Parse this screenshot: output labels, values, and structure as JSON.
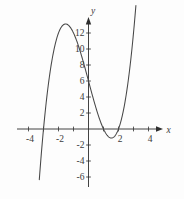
{
  "figure": {
    "background": "#fdfdfd",
    "axis_color": "#2e2e2e",
    "curve_color": "#474747",
    "text_color": "#3b3b3b",
    "x_axis_label": "x",
    "y_axis_label": "y"
  },
  "chart_data": {
    "type": "line",
    "title": "",
    "function": "y = x^3 - 7x + 6",
    "function_factored": "y = (x + 3)(x - 1)(x - 2)",
    "coefficients": {
      "x3": 1,
      "x2": 0,
      "x1": -7,
      "x0": 6
    },
    "domain": [
      -3.28,
      3.16
    ],
    "xlabel": "x",
    "ylabel": "y",
    "xlim": [
      -4.9,
      5.1
    ],
    "ylim": [
      -8.7,
      14.0
    ],
    "grid": false,
    "legend": null,
    "x_ticks": [
      -4,
      -3,
      -2,
      -1,
      1,
      2,
      3,
      4
    ],
    "x_tick_labels": [
      {
        "value": -4,
        "label": "-4"
      },
      {
        "value": -2,
        "label": "-2"
      },
      {
        "value": 2,
        "label": "2"
      },
      {
        "value": 4,
        "label": "4"
      }
    ],
    "y_ticks": [
      -6,
      -4,
      -2,
      2,
      4,
      6,
      8,
      10,
      12
    ],
    "y_tick_labels": [
      {
        "value": 12,
        "label": "12"
      },
      {
        "value": 10,
        "label": "10"
      },
      {
        "value": 8,
        "label": "8"
      },
      {
        "value": 6,
        "label": "6"
      },
      {
        "value": 4,
        "label": "4"
      },
      {
        "value": 2,
        "label": "2"
      },
      {
        "value": -2,
        "label": "-2"
      },
      {
        "value": -4,
        "label": "-4"
      },
      {
        "value": -6,
        "label": "-6"
      }
    ],
    "key_points": {
      "x_intercepts": [
        -3,
        1,
        2
      ],
      "y_intercept": 6,
      "local_max": {
        "x": -1.53,
        "y": 13.13
      },
      "local_min": {
        "x": 1.53,
        "y": -1.13
      }
    }
  }
}
